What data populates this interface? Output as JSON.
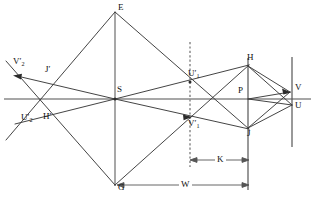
{
  "figure": {
    "type": "optical-ray-diagram",
    "background_color": "#ffffff",
    "line_color": "#333333",
    "axis_color": "#888888",
    "label_color": "#111111"
  },
  "points": {
    "E": {
      "label": "E",
      "x": 115,
      "y": 12,
      "label_dx": 4,
      "label_dy": -10
    },
    "G": {
      "label": "G",
      "x": 115,
      "y": 185,
      "label_dx": 3,
      "label_dy": 0
    },
    "S": {
      "label": "S",
      "x": 115,
      "y": 99,
      "label_dx": 3,
      "label_dy": -13
    },
    "H": {
      "label": "H",
      "x": 248,
      "y": 66,
      "label_dx": 1,
      "label_dy": -12
    },
    "J": {
      "label": "J",
      "x": 248,
      "y": 128,
      "label_dx": 1,
      "label_dy": 2
    },
    "P": {
      "label": "P",
      "x": 248,
      "y": 99,
      "label_dx": -10,
      "label_dy": -12
    },
    "V": {
      "label": "V",
      "x": 292,
      "y": 92,
      "label_dx": 4,
      "label_dy": -9
    },
    "U": {
      "label": "U",
      "x": 292,
      "y": 106,
      "label_dx": 4,
      "label_dy": -4
    },
    "Jp": {
      "label": "J",
      "prime": true,
      "x": 48,
      "y": 78,
      "label_dx": 0,
      "label_dy": -14
    },
    "Hp": {
      "label": "H",
      "prime": true,
      "x": 40,
      "y": 110,
      "label_dx": 3,
      "label_dy": 1
    },
    "V2p": {
      "label": "V",
      "sub": "2",
      "prime": true,
      "x": 18,
      "y": 78,
      "label_dx": -2,
      "label_dy": -22
    },
    "U2p": {
      "label": "U",
      "sub": "2",
      "prime": true,
      "x": 16,
      "y": 122,
      "label_dx": 6,
      "label_dy": -6
    },
    "U1p": {
      "label": "U",
      "sub": "1",
      "prime": true,
      "x": 190,
      "y": 82,
      "label_dx": -1,
      "label_dy": -12
    },
    "V1p": {
      "label": "V",
      "sub": "1",
      "prime": true,
      "x": 190,
      "y": 118,
      "label_dx": -1,
      "label_dy": 2
    }
  },
  "dimensions": [
    {
      "name": "W",
      "label": "W",
      "x1": 118,
      "x2": 248,
      "y": 185,
      "label_x": 183,
      "label_y": 179
    },
    {
      "name": "K",
      "label": "K",
      "x1": 190,
      "x2": 248,
      "y": 160,
      "label_x": 219,
      "label_y": 154
    }
  ],
  "axis": {
    "name": "optical-axis",
    "x1": 4,
    "x2": 311,
    "y": 99
  },
  "vertical_lines": [
    {
      "name": "lens-plane-S",
      "x": 115,
      "y1": 12,
      "y2": 185,
      "style": "solid"
    },
    {
      "name": "image-plane-dashed",
      "x": 190,
      "y1": 42,
      "y2": 167,
      "style": "dashed"
    },
    {
      "name": "plane-HJ",
      "x": 248,
      "y1": 58,
      "y2": 188,
      "style": "solid"
    },
    {
      "name": "plane-VU",
      "x": 292,
      "y1": 57,
      "y2": 146,
      "style": "solid"
    }
  ],
  "rays": [
    {
      "name": "ray-E-G",
      "from": "E",
      "to": "G"
    },
    {
      "name": "ray-U2p-E",
      "from": [
        7,
        138
      ],
      "to": [
        115,
        12
      ]
    },
    {
      "name": "ray-E-J",
      "from": [
        115,
        12
      ],
      "to": [
        248,
        128
      ]
    },
    {
      "name": "ray-G-H",
      "from": [
        115,
        185
      ],
      "to": [
        248,
        66
      ]
    },
    {
      "name": "ray-V2p-G",
      "from": [
        8,
        65
      ],
      "to": [
        115,
        185
      ]
    },
    {
      "name": "ray-arrow-to-V2p",
      "from": [
        115,
        99
      ],
      "to": [
        14,
        76
      ]
    },
    {
      "name": "ray-arrow-to-U2p",
      "from": [
        115,
        99
      ],
      "to": [
        14,
        124
      ]
    },
    {
      "name": "ray-S-U1p-H",
      "from": [
        115,
        99
      ],
      "to": [
        248,
        66
      ]
    },
    {
      "name": "ray-S-V1p-J",
      "from": [
        115,
        99
      ],
      "to": [
        248,
        128
      ]
    },
    {
      "name": "ray-H-V",
      "from": [
        248,
        66
      ],
      "to": [
        290,
        92
      ]
    },
    {
      "name": "ray-H-U",
      "from": [
        248,
        66
      ],
      "to": [
        291,
        105
      ]
    },
    {
      "name": "ray-J-V",
      "from": [
        248,
        128
      ],
      "to": [
        290,
        92
      ]
    },
    {
      "name": "ray-J-U",
      "from": [
        248,
        128
      ],
      "to": [
        291,
        105
      ]
    },
    {
      "name": "ray-P-V",
      "from": [
        248,
        99
      ],
      "to": [
        290,
        92
      ]
    },
    {
      "name": "ray-P-U",
      "from": [
        248,
        99
      ],
      "to": [
        291,
        105
      ]
    }
  ],
  "arrowheads": [
    {
      "name": "arrowhead-V2p",
      "x": 16,
      "y": 77,
      "angle": 193
    },
    {
      "name": "arrowhead-V1p",
      "x": 190,
      "y": 117,
      "angle": 14
    },
    {
      "name": "arrowhead-V",
      "x": 289,
      "y": 92,
      "angle": 31
    }
  ]
}
